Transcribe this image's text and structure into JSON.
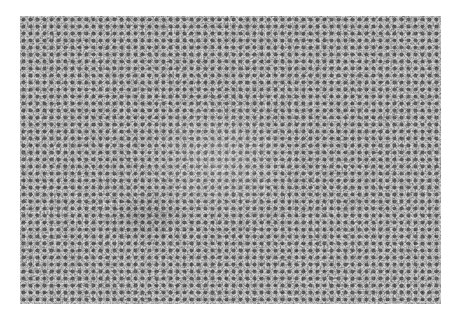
{
  "image": {
    "kind": "grayscale micrograph",
    "subject": "densely packed round cells with a lighter central region",
    "colors": {
      "background": "#ffffff",
      "cell_dark": "#1a1a1a",
      "cell_mid": "#6b6b6b",
      "cell_light": "#d8d8d8"
    }
  }
}
